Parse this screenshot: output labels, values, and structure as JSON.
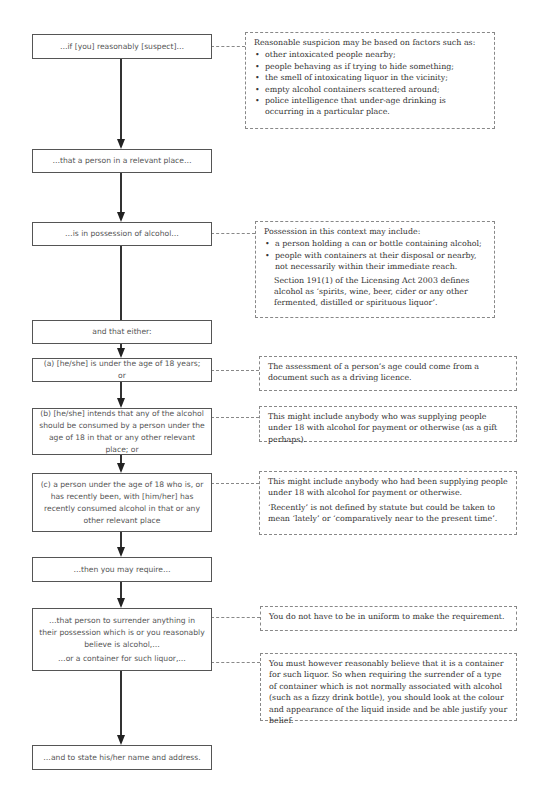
{
  "header": {
    "text": "6.6  Confiscation of Alcohol"
  },
  "flow": {
    "nodes": [
      {
        "id": "suspect",
        "text": "…if [you] reasonably [suspect]…"
      },
      {
        "id": "person",
        "text": "…that a person in a relevant place…"
      },
      {
        "id": "possession",
        "text": "…is in possession of alcohol…"
      },
      {
        "id": "either",
        "text": "and that either:"
      },
      {
        "id": "a",
        "text": "(a) [he/she] is under the age of 18 years; or"
      },
      {
        "id": "b",
        "text": "(b) [he/she] intends that any of the alcohol should be consumed by a person under the age of 18 in that or any other relevant place; or"
      },
      {
        "id": "c",
        "text": "(c) a person under the age of 18 who is, or has recently been, with [him/her] has recently consumed alcohol in that or any other relevant place"
      },
      {
        "id": "require",
        "text": "…then you may require…"
      },
      {
        "id": "surrender",
        "text": "…that person to surrender anything in their possession which is or you reasonably believe is alcohol,…",
        "text2": "…or a container for such liquor,…"
      },
      {
        "id": "name",
        "text": "…and to state his/her name and address."
      }
    ]
  },
  "notes": {
    "suspicion": {
      "intro": "Reasonable suspicion may be based on factors such as:",
      "items": [
        "other intoxicated people nearby;",
        "people behaving as if trying to hide something;",
        "the smell of intoxicating liquor in the vicinity;",
        "empty alcohol containers scattered around;",
        "police intelligence that under-age drinking is occurring in a particular place."
      ]
    },
    "possession": {
      "intro": "Possession in this context may include:",
      "items": [
        "a person holding a can or bottle containing alcohol;",
        "people with containers at their disposal or nearby, not necessarily within their immediate reach."
      ],
      "extra": "Section 191(1) of the Licensing Act 2003 defines alcohol as ‘spirits, wine, beer, cider or any other fermented, distilled or spirituous liquor’."
    },
    "age": {
      "text": "The assessment of a person’s age could come from a document such as a driving licence."
    },
    "supply_b": {
      "text": "This might include anybody who was supplying people under 18 with alcohol for payment or otherwise (as a gift perhaps)."
    },
    "supply_c": {
      "text": "This might include anybody who had been supplying people under 18 with alcohol for payment or otherwise.",
      "text2": "‘Recently’ is not defined by statute but could be taken to mean ‘lately’ or ‘comparatively near to the present time’."
    },
    "uniform": {
      "text": "You do not have to be in uniform to make the requirement."
    },
    "container": {
      "text": "You must however reasonably believe that it is a container for such liquor. So when requiring the surrender of a type of container which is not normally associated with alcohol (such as a fizzy drink bottle), you should look at the colour and appearance of the liquid inside and be able justify your belief."
    }
  }
}
